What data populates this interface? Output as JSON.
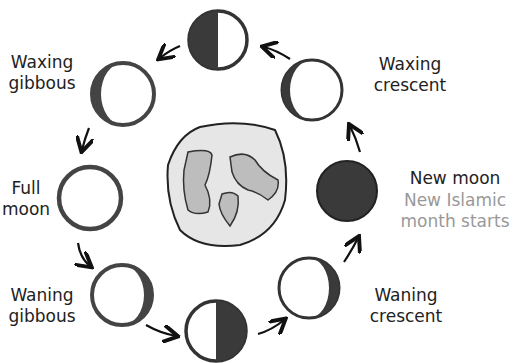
{
  "title_partial": "",
  "phases": [
    {
      "id": "first-quarter",
      "label": "",
      "cx": 218,
      "cy": 40,
      "r": 30
    },
    {
      "id": "waxing-crescent",
      "label": "Waxing\ncrescent",
      "cx": 312,
      "cy": 90,
      "r": 31
    },
    {
      "id": "new-moon",
      "label": "New moon",
      "sublabel": "New Islamic\nmonth starts",
      "cx": 347,
      "cy": 191,
      "r": 31
    },
    {
      "id": "waning-crescent",
      "label": "Waning\ncrescent",
      "cx": 309,
      "cy": 288,
      "r": 31
    },
    {
      "id": "last-quarter",
      "label": "",
      "cx": 216,
      "cy": 331,
      "r": 31
    },
    {
      "id": "waning-gibbous",
      "label": "Waning\ngibbous",
      "cx": 122,
      "cy": 295,
      "r": 31
    },
    {
      "id": "full-moon",
      "label": "Full\nmoon",
      "cx": 90,
      "cy": 198,
      "r": 32
    },
    {
      "id": "waxing-gibbous",
      "label": "Waxing\ngibbous",
      "cx": 123,
      "cy": 94,
      "r": 32
    }
  ],
  "labels": {
    "waxing_gibbous": "Waxing\ngibbous",
    "waxing_crescent": "Waxing\ncrescent",
    "full_moon": "Full\nmoon",
    "new_moon": "New moon",
    "new_moon_note": "New Islamic\nmonth starts",
    "waning_gibbous": "Waning\ngibbous",
    "waning_crescent": "Waning\ncrescent"
  },
  "colors": {
    "dark": "#3a3a3a",
    "note": "#999999",
    "earth_fill": "#e6e6e6",
    "continent_fill": "#bdbdbd"
  }
}
